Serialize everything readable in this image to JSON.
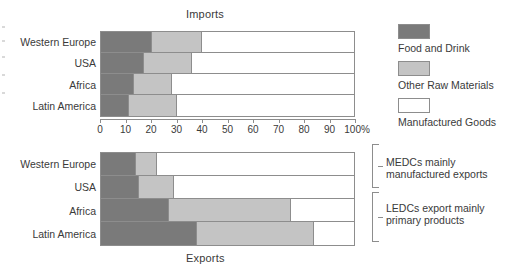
{
  "charts": {
    "imports": {
      "title": "Imports"
    },
    "exports": {
      "title": "Exports"
    }
  },
  "legend": {
    "items": [
      {
        "label": "Food and Drink",
        "color": "#7a7a7a",
        "key": "food"
      },
      {
        "label": "Other Raw Materials",
        "color": "#c4c4c4",
        "key": "raw"
      },
      {
        "label": "Manufactured Goods",
        "color": "#ffffff",
        "key": "manufactured"
      }
    ]
  },
  "axis": {
    "ticks": [
      "0",
      "10",
      "20",
      "30",
      "40",
      "50",
      "60",
      "70",
      "80",
      "90",
      "100%"
    ],
    "min": 0,
    "max": 100
  },
  "annotations": [
    {
      "line1": "MEDCs mainly",
      "line2": "manufactured exports"
    },
    {
      "line1": "LEDCs export mainly",
      "line2": "primary products"
    }
  ],
  "categories": [
    "Western Europe",
    "USA",
    "Africa",
    "Latin America"
  ],
  "chart_data": [
    {
      "type": "bar",
      "orientation": "horizontal",
      "stacked": true,
      "normalized_percent": true,
      "title": "Imports",
      "xlabel": "",
      "ylabel": "",
      "xlim": [
        0,
        100
      ],
      "grid": false,
      "legend_position": "right",
      "categories": [
        "Western Europe",
        "USA",
        "Africa",
        "Latin America"
      ],
      "series": [
        {
          "name": "Food and Drink",
          "values": [
            20,
            17,
            13,
            11
          ]
        },
        {
          "name": "Other Raw Materials",
          "values": [
            20,
            19,
            15,
            19
          ]
        },
        {
          "name": "Manufactured Goods",
          "values": [
            60,
            64,
            72,
            70
          ]
        }
      ]
    },
    {
      "type": "bar",
      "orientation": "horizontal",
      "stacked": true,
      "normalized_percent": true,
      "title": "Exports",
      "xlabel": "",
      "ylabel": "",
      "xlim": [
        0,
        100
      ],
      "grid": false,
      "legend_position": "right",
      "categories": [
        "Western Europe",
        "USA",
        "Africa",
        "Latin America"
      ],
      "series": [
        {
          "name": "Food and Drink",
          "values": [
            14,
            15,
            27,
            38
          ]
        },
        {
          "name": "Other Raw Materials",
          "values": [
            8,
            14,
            48,
            46
          ]
        },
        {
          "name": "Manufactured Goods",
          "values": [
            78,
            71,
            25,
            16
          ]
        }
      ]
    }
  ]
}
